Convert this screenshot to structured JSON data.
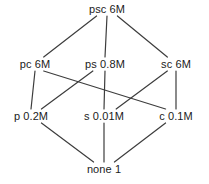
{
  "diagram": {
    "type": "hasse-lattice",
    "title": "",
    "nodes": [
      {
        "id": "psc",
        "label": "psc 6M",
        "x": 107,
        "y": 3,
        "level": 0
      },
      {
        "id": "pc",
        "label": "pc 6M",
        "x": 35,
        "y": 58,
        "level": 1
      },
      {
        "id": "ps",
        "label": "ps 0.8M",
        "x": 105,
        "y": 58,
        "level": 1
      },
      {
        "id": "sc",
        "label": "sc 6M",
        "x": 176,
        "y": 58,
        "level": 1
      },
      {
        "id": "p",
        "label": "p 0.2M",
        "x": 31,
        "y": 110,
        "level": 2
      },
      {
        "id": "s",
        "label": "s 0.01M",
        "x": 104,
        "y": 110,
        "level": 2
      },
      {
        "id": "c",
        "label": "c 0.1M",
        "x": 176,
        "y": 110,
        "level": 2
      },
      {
        "id": "none",
        "label": "none 1",
        "x": 104,
        "y": 163,
        "level": 3
      }
    ],
    "edges": [
      {
        "from": "psc",
        "to": "pc"
      },
      {
        "from": "psc",
        "to": "ps"
      },
      {
        "from": "psc",
        "to": "sc"
      },
      {
        "from": "pc",
        "to": "p"
      },
      {
        "from": "pc",
        "to": "c"
      },
      {
        "from": "ps",
        "to": "p"
      },
      {
        "from": "ps",
        "to": "s"
      },
      {
        "from": "sc",
        "to": "s"
      },
      {
        "from": "sc",
        "to": "c"
      },
      {
        "from": "p",
        "to": "none"
      },
      {
        "from": "s",
        "to": "none"
      },
      {
        "from": "c",
        "to": "none"
      }
    ],
    "style": {
      "edge_color": "#3d3d3d",
      "edge_width": 1.2,
      "label_color": "#1b1b1b",
      "background": "#ffffff"
    }
  }
}
